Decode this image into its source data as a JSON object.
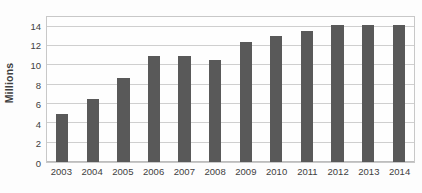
{
  "chart_data": {
    "type": "bar",
    "title": "",
    "subtitle": "",
    "xlabel": "",
    "ylabel": "Millions",
    "categories": [
      "2003",
      "2004",
      "2005",
      "2006",
      "2007",
      "2008",
      "2009",
      "2010",
      "2011",
      "2012",
      "2013",
      "2014"
    ],
    "values": [
      5.0,
      6.5,
      8.7,
      11.0,
      11.0,
      10.6,
      12.4,
      13.0,
      13.6,
      14.2,
      14.2,
      14.2
    ],
    "ylim": [
      0,
      15
    ],
    "yticks": [
      0,
      2,
      4,
      6,
      8,
      10,
      12,
      14
    ],
    "ytick_labels": [
      "0",
      "2",
      "4",
      "6",
      "8",
      "10",
      "12",
      "14"
    ],
    "grid": true,
    "grid_axis": "y",
    "legend": false,
    "legend_position": "none",
    "series": [
      {
        "name": "Millions",
        "color": "#595959",
        "values": [
          5.0,
          6.5,
          8.7,
          11.0,
          11.0,
          10.6,
          12.4,
          13.0,
          13.6,
          14.2,
          14.2,
          14.2
        ]
      }
    ],
    "colors": {
      "bar": "#595959",
      "gridline": "#cfcfcf",
      "border": "#c8c8c8",
      "text": "#404040",
      "background": "#fdfdfd"
    }
  }
}
